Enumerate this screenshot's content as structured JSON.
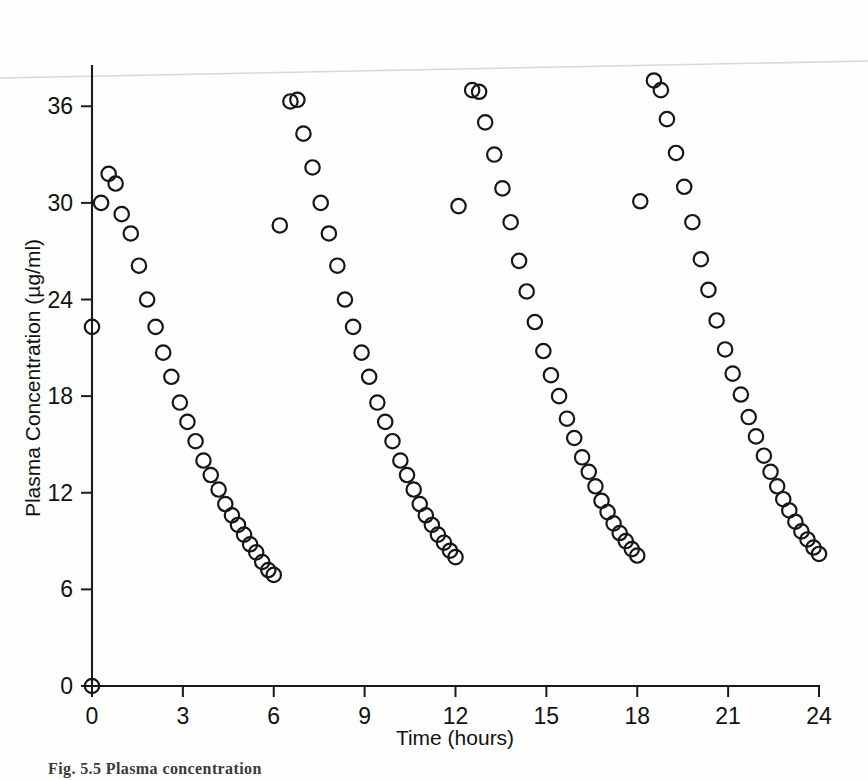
{
  "figure": {
    "caption_partial": "Fig. 5.5   Plasma concentration"
  },
  "chart_data": {
    "type": "scatter",
    "title": "",
    "subtitle": "",
    "xlabel": "Time (hours)",
    "ylabel": "Plasma Concentration (µg/ml)",
    "xlim": [
      0,
      24
    ],
    "ylim": [
      0,
      38.5
    ],
    "xticks": [
      0,
      3,
      6,
      9,
      12,
      15,
      18,
      21,
      24
    ],
    "yticks": [
      0,
      6,
      12,
      18,
      24,
      30,
      36
    ],
    "xtick_labels": [
      "0",
      "3",
      "6",
      "9",
      "12",
      "15",
      "18",
      "21",
      "24"
    ],
    "ytick_labels": [
      "0",
      "6",
      "12",
      "18",
      "24",
      "30",
      "36"
    ],
    "grid": false,
    "legend": null,
    "marker": "open-circle",
    "marker_color": "#171717",
    "annotations": [
      {
        "name": "page-edge-scan-line",
        "type": "faint-line",
        "color": "#d8d8d8",
        "from": [
          0,
          37.1
        ],
        "to": [
          24,
          38.0
        ]
      }
    ],
    "series": [
      {
        "name": "Plasma concentration",
        "points": [
          [
            0.0,
            0.0
          ],
          [
            0.0,
            22.3
          ],
          [
            0.55,
            31.8
          ],
          [
            0.78,
            31.2
          ],
          [
            0.3,
            30.0
          ],
          [
            0.98,
            29.3
          ],
          [
            1.28,
            28.1
          ],
          [
            1.55,
            26.1
          ],
          [
            1.82,
            24.0
          ],
          [
            2.1,
            22.3
          ],
          [
            2.35,
            20.7
          ],
          [
            2.62,
            19.2
          ],
          [
            2.9,
            17.6
          ],
          [
            3.15,
            16.4
          ],
          [
            3.42,
            15.2
          ],
          [
            3.68,
            14.0
          ],
          [
            3.92,
            13.1
          ],
          [
            4.18,
            12.2
          ],
          [
            4.4,
            11.3
          ],
          [
            4.62,
            10.6
          ],
          [
            4.82,
            10.0
          ],
          [
            5.02,
            9.4
          ],
          [
            5.22,
            8.8
          ],
          [
            5.42,
            8.3
          ],
          [
            5.62,
            7.7
          ],
          [
            5.82,
            7.2
          ],
          [
            6.0,
            6.9
          ],
          [
            6.2,
            28.6
          ],
          [
            6.55,
            36.3
          ],
          [
            6.78,
            36.4
          ],
          [
            6.98,
            34.3
          ],
          [
            7.28,
            32.2
          ],
          [
            7.55,
            30.0
          ],
          [
            7.82,
            28.1
          ],
          [
            8.1,
            26.1
          ],
          [
            8.35,
            24.0
          ],
          [
            8.62,
            22.3
          ],
          [
            8.9,
            20.7
          ],
          [
            9.15,
            19.2
          ],
          [
            9.42,
            17.6
          ],
          [
            9.68,
            16.4
          ],
          [
            9.92,
            15.2
          ],
          [
            10.18,
            14.0
          ],
          [
            10.4,
            13.1
          ],
          [
            10.62,
            12.2
          ],
          [
            10.82,
            11.3
          ],
          [
            11.02,
            10.6
          ],
          [
            11.22,
            10.0
          ],
          [
            11.42,
            9.4
          ],
          [
            11.62,
            8.9
          ],
          [
            11.82,
            8.4
          ],
          [
            12.0,
            8.0
          ],
          [
            12.1,
            29.8
          ],
          [
            12.55,
            37.0
          ],
          [
            12.78,
            36.9
          ],
          [
            12.98,
            35.0
          ],
          [
            13.28,
            33.0
          ],
          [
            13.55,
            30.9
          ],
          [
            13.82,
            28.8
          ],
          [
            14.1,
            26.4
          ],
          [
            14.35,
            24.5
          ],
          [
            14.62,
            22.6
          ],
          [
            14.9,
            20.8
          ],
          [
            15.15,
            19.3
          ],
          [
            15.42,
            18.0
          ],
          [
            15.68,
            16.6
          ],
          [
            15.92,
            15.4
          ],
          [
            16.18,
            14.2
          ],
          [
            16.4,
            13.3
          ],
          [
            16.62,
            12.4
          ],
          [
            16.82,
            11.5
          ],
          [
            17.02,
            10.8
          ],
          [
            17.22,
            10.1
          ],
          [
            17.42,
            9.5
          ],
          [
            17.62,
            9.0
          ],
          [
            17.82,
            8.5
          ],
          [
            18.0,
            8.1
          ],
          [
            18.1,
            30.1
          ],
          [
            18.55,
            37.6
          ],
          [
            18.78,
            37.0
          ],
          [
            18.98,
            35.2
          ],
          [
            19.28,
            33.1
          ],
          [
            19.55,
            31.0
          ],
          [
            19.82,
            28.8
          ],
          [
            20.1,
            26.5
          ],
          [
            20.35,
            24.6
          ],
          [
            20.62,
            22.7
          ],
          [
            20.9,
            20.9
          ],
          [
            21.15,
            19.4
          ],
          [
            21.42,
            18.1
          ],
          [
            21.68,
            16.7
          ],
          [
            21.92,
            15.5
          ],
          [
            22.18,
            14.3
          ],
          [
            22.4,
            13.3
          ],
          [
            22.62,
            12.4
          ],
          [
            22.82,
            11.6
          ],
          [
            23.02,
            10.9
          ],
          [
            23.22,
            10.2
          ],
          [
            23.42,
            9.6
          ],
          [
            23.62,
            9.1
          ],
          [
            23.82,
            8.6
          ],
          [
            24.0,
            8.2
          ]
        ]
      }
    ]
  }
}
